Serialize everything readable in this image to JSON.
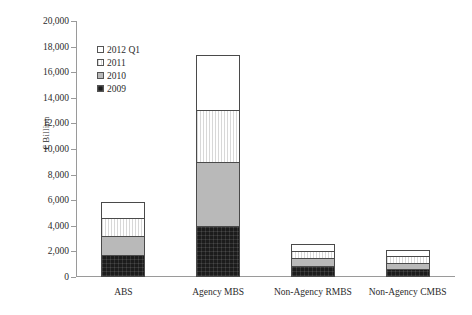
{
  "chart_data": {
    "type": "bar",
    "subtype": "stacked-vertical",
    "title": "",
    "subtitle": "",
    "xlabel": "",
    "ylabel": "€ Billion",
    "categories": [
      "ABS",
      "Agency MBS",
      "Non-Agency RMBS",
      "Non-Agency CMBS"
    ],
    "series": [
      {
        "name": "2009",
        "values": [
          1650,
          3900,
          800,
          550
        ]
      },
      {
        "name": "2010",
        "values": [
          1500,
          5000,
          600,
          500
        ]
      },
      {
        "name": "2011",
        "values": [
          1350,
          4100,
          550,
          500
        ]
      },
      {
        "name": "2012 Q1",
        "values": [
          1250,
          4250,
          550,
          500
        ]
      }
    ],
    "totals": [
      5750,
      17250,
      2500,
      2050
    ],
    "ylim": [
      0,
      20000
    ],
    "ytick_interval": 2000,
    "ytick_labels": [
      "0",
      "2,000",
      "4,000",
      "6,000",
      "8,000",
      "10,000",
      "12,000",
      "14,000",
      "16,000",
      "18,000",
      "20,000"
    ],
    "ytick_values": [
      0,
      2000,
      4000,
      6000,
      8000,
      10000,
      12000,
      14000,
      16000,
      18000,
      20000
    ],
    "grid": false,
    "legend_position": "upper-left-inside",
    "legend_entries": [
      {
        "label": "2012 Q1",
        "swatch": "white",
        "color": "#ffffff"
      },
      {
        "label": "2011",
        "swatch": "light-hatch",
        "color": "#f2f2f2"
      },
      {
        "label": "2010",
        "swatch": "gray",
        "color": "#b9b9b9"
      },
      {
        "label": "2009",
        "swatch": "black",
        "color": "#1c1c1c"
      }
    ]
  },
  "colors": {
    "axis": "#9a9a9a",
    "text": "#2b2b2b",
    "bar_outline": "#4a4a4a",
    "s2009": "#1c1c1c",
    "s2010": "#b9b9b9",
    "s2011": "#f2f2f2",
    "s2012": "#ffffff",
    "background": "#ffffff"
  }
}
